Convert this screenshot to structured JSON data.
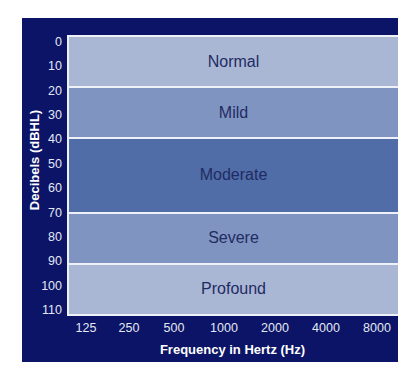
{
  "chart_data": {
    "type": "table",
    "title": "",
    "xlabel": "Frequency in Hertz (Hz)",
    "ylabel": "Decibels (dBHL)",
    "x_ticks": [
      "125",
      "250",
      "500",
      "1000",
      "2000",
      "4000",
      "8000"
    ],
    "y_ticks": [
      "0",
      "10",
      "20",
      "30",
      "40",
      "50",
      "60",
      "70",
      "80",
      "90",
      "100",
      "110"
    ],
    "ylim": [
      0,
      110
    ],
    "y_inverted": true,
    "bands": [
      {
        "label": "Normal",
        "from": 0,
        "to": 20,
        "color": "#a9b7d5"
      },
      {
        "label": "Mild",
        "from": 20,
        "to": 40,
        "color": "#8094c1"
      },
      {
        "label": "Moderate",
        "from": 40,
        "to": 70,
        "color": "#506da7"
      },
      {
        "label": "Severe",
        "from": 70,
        "to": 90,
        "color": "#8094c1"
      },
      {
        "label": "Profound",
        "from": 90,
        "to": 110,
        "color": "#a9b7d5"
      }
    ],
    "grid": false,
    "legend": "none"
  },
  "colors": {
    "frame": "#0b1466",
    "band_text": "#1f2b63",
    "tick_text": "#e4e8f4"
  }
}
